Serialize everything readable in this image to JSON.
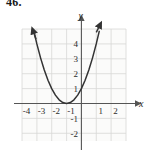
{
  "problem": {
    "number": "46."
  },
  "figure": {
    "x_axis_label": "x",
    "y_axis_label": "y",
    "x_tick_labels": [
      "-4",
      "-3",
      "-2",
      "-1",
      "1",
      "2"
    ],
    "y_tick_labels": [
      "4",
      "3",
      "2",
      "1",
      "-1",
      "-2"
    ],
    "colors": {
      "background": "#fbfbfa",
      "grid": "#d8d8d6",
      "axis": "#6f6f6f",
      "curve": "#333333",
      "text": "#2b2b2b"
    }
  },
  "chart_data": {
    "type": "line",
    "title": "",
    "subtitle": "",
    "xlabel": "x",
    "ylabel": "y",
    "xlim": [
      -4.5,
      2.5
    ],
    "ylim": [
      -2.5,
      5.0
    ],
    "grid": true,
    "legend": null,
    "xticks": [
      -4,
      -3,
      -2,
      -1,
      1,
      2
    ],
    "yticks": [
      4,
      3,
      2,
      1,
      -1,
      -2
    ],
    "annotations": [
      "arrowhead on left branch",
      "arrowhead on right branch",
      "x-axis arrowhead at right",
      "y-axis arrowhead at top"
    ],
    "series": [
      {
        "name": "parabola",
        "equation": "y = (x + 1)^2",
        "vertex": [
          -1,
          0
        ],
        "opens": "up",
        "x": [
          -3.2,
          -3.0,
          -2.75,
          -2.5,
          -2.25,
          -2.0,
          -1.75,
          -1.5,
          -1.25,
          -1.0,
          -0.75,
          -0.5,
          -0.25,
          0.0,
          0.25,
          0.5,
          0.75,
          1.0,
          1.2
        ],
        "values": [
          4.84,
          4.0,
          3.0625,
          2.25,
          1.5625,
          1.0,
          0.5625,
          0.25,
          0.0625,
          0.0,
          0.0625,
          0.25,
          0.5625,
          1.0,
          1.5625,
          2.25,
          3.0625,
          4.0,
          4.84
        ]
      }
    ]
  }
}
